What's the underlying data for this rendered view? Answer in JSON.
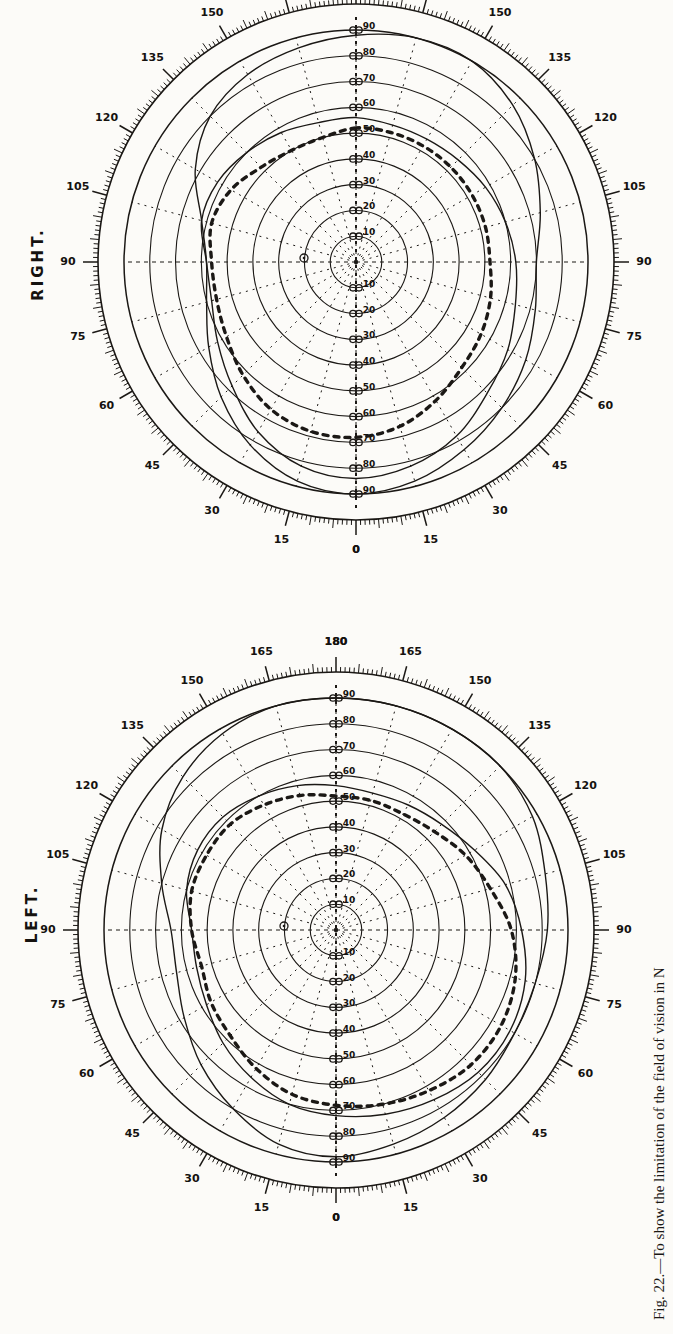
{
  "figure": {
    "caption": "Fig. 22.—To show the limitation of the field of vision in N",
    "charts": [
      {
        "id": "right",
        "title": "RIGHT.",
        "center_mark": "o"
      },
      {
        "id": "left",
        "title": "LEFT.",
        "center_mark": "o"
      }
    ]
  },
  "chart_data": [
    {
      "type": "line",
      "title": "RIGHT.",
      "subtitle": "",
      "plot_kind": "polar-perimetry-field-chart",
      "xlabel": "",
      "ylabel": "",
      "grid": true,
      "legend_position": "none",
      "angular_axis": {
        "label": "meridian degrees",
        "unit": "degrees",
        "range": [
          0,
          180
        ],
        "tick_step_minor": 1,
        "tick_step_major": 15,
        "tick_labels_upper": [
          "0",
          "15",
          "30",
          "45",
          "60",
          "75",
          "90",
          "105",
          "120",
          "135",
          "150",
          "165",
          "180"
        ],
        "tick_labels_lower": [
          "0",
          "15",
          "30",
          "45",
          "60",
          "75",
          "90",
          "105",
          "120",
          "135",
          "150",
          "165",
          "180"
        ]
      },
      "radial_axis": {
        "label": "eccentricity degrees",
        "unit": "degrees",
        "ring_values": [
          10,
          20,
          30,
          40,
          50,
          60,
          70,
          80,
          90
        ],
        "tick_labels_left": [
          "90",
          "80",
          "70",
          "60",
          "50",
          "40",
          "30",
          "20",
          "10"
        ],
        "tick_labels_right": [
          "10",
          "20",
          "30",
          "40",
          "50",
          "60",
          "70",
          "80",
          "90"
        ]
      },
      "series": [
        {
          "name": "outer field limit (solid)",
          "style": "solid",
          "points_polar_deg": [
            [
              0,
              88
            ],
            [
              15,
              86
            ],
            [
              30,
              84
            ],
            [
              45,
              80
            ],
            [
              60,
              72
            ],
            [
              75,
              62
            ],
            [
              90,
              58
            ],
            [
              105,
              60
            ],
            [
              120,
              66
            ],
            [
              135,
              74
            ],
            [
              150,
              82
            ],
            [
              165,
              88
            ],
            [
              180,
              90
            ],
            [
              195,
              88
            ],
            [
              210,
              84
            ],
            [
              225,
              80
            ],
            [
              240,
              76
            ],
            [
              255,
              72
            ],
            [
              270,
              70
            ],
            [
              285,
              74
            ],
            [
              300,
              80
            ],
            [
              315,
              86
            ],
            [
              330,
              90
            ],
            [
              345,
              90
            ]
          ]
        },
        {
          "name": "inner field limit (solid)",
          "style": "solid",
          "points_polar_deg": [
            [
              0,
              56
            ],
            [
              15,
              56
            ],
            [
              30,
              58
            ],
            [
              45,
              60
            ],
            [
              60,
              62
            ],
            [
              75,
              62
            ],
            [
              90,
              58
            ],
            [
              105,
              58
            ],
            [
              120,
              62
            ],
            [
              135,
              68
            ],
            [
              150,
              76
            ],
            [
              165,
              82
            ],
            [
              180,
              84
            ],
            [
              195,
              82
            ],
            [
              210,
              78
            ],
            [
              225,
              72
            ],
            [
              240,
              68
            ],
            [
              255,
              64
            ],
            [
              270,
              62
            ],
            [
              285,
              60
            ],
            [
              300,
              58
            ],
            [
              315,
              56
            ],
            [
              330,
              55
            ],
            [
              345,
              55
            ]
          ]
        },
        {
          "name": "colour field limit (dotted)",
          "style": "dotted-heavy",
          "points_polar_deg": [
            [
              0,
              52
            ],
            [
              15,
              50
            ],
            [
              30,
              50
            ],
            [
              45,
              52
            ],
            [
              60,
              56
            ],
            [
              75,
              58
            ],
            [
              90,
              56
            ],
            [
              105,
              56
            ],
            [
              120,
              58
            ],
            [
              135,
              62
            ],
            [
              150,
              66
            ],
            [
              165,
              68
            ],
            [
              180,
              68
            ],
            [
              195,
              66
            ],
            [
              210,
              62
            ],
            [
              225,
              58
            ],
            [
              240,
              56
            ],
            [
              255,
              54
            ],
            [
              270,
              52
            ],
            [
              285,
              52
            ],
            [
              300,
              52
            ],
            [
              315,
              52
            ],
            [
              330,
              52
            ],
            [
              345,
              52
            ]
          ]
        }
      ],
      "annotations": [
        {
          "text": "o",
          "note": "fixation / blind-spot mark near centre"
        }
      ]
    },
    {
      "type": "line",
      "title": "LEFT.",
      "subtitle": "",
      "plot_kind": "polar-perimetry-field-chart",
      "xlabel": "",
      "ylabel": "",
      "grid": true,
      "legend_position": "none",
      "angular_axis": {
        "label": "meridian degrees",
        "unit": "degrees",
        "range": [
          0,
          180
        ],
        "tick_step_minor": 1,
        "tick_step_major": 15,
        "tick_labels_upper": [
          "0",
          "15",
          "30",
          "45",
          "60",
          "75",
          "90",
          "105",
          "120",
          "135",
          "150",
          "165",
          "180"
        ],
        "tick_labels_lower": [
          "0",
          "15",
          "30",
          "45",
          "60",
          "75",
          "90",
          "105",
          "120",
          "135",
          "150",
          "165",
          "180"
        ]
      },
      "radial_axis": {
        "label": "eccentricity degrees",
        "unit": "degrees",
        "ring_values": [
          10,
          20,
          30,
          40,
          50,
          60,
          70,
          80,
          90
        ],
        "tick_labels_left": [
          "90",
          "80",
          "70",
          "60",
          "50",
          "40",
          "30",
          "20",
          "10"
        ],
        "tick_labels_right": [
          "10",
          "20",
          "30",
          "40",
          "50",
          "60",
          "70",
          "80",
          "90"
        ]
      },
      "series": [
        {
          "name": "outer field limit (solid)",
          "style": "solid",
          "points_polar_deg": [
            [
              0,
              90
            ],
            [
              15,
              90
            ],
            [
              30,
              88
            ],
            [
              45,
              84
            ],
            [
              60,
              78
            ],
            [
              75,
              70
            ],
            [
              90,
              64
            ],
            [
              105,
              64
            ],
            [
              120,
              68
            ],
            [
              135,
              74
            ],
            [
              150,
              80
            ],
            [
              165,
              86
            ],
            [
              180,
              88
            ],
            [
              195,
              86
            ],
            [
              210,
              84
            ],
            [
              225,
              82
            ],
            [
              240,
              80
            ],
            [
              255,
              80
            ],
            [
              270,
              82
            ],
            [
              285,
              84
            ],
            [
              300,
              88
            ],
            [
              315,
              90
            ],
            [
              330,
              90
            ],
            [
              345,
              90
            ]
          ]
        },
        {
          "name": "inner field limit (solid)",
          "style": "solid",
          "points_polar_deg": [
            [
              0,
              56
            ],
            [
              15,
              58
            ],
            [
              30,
              60
            ],
            [
              45,
              62
            ],
            [
              60,
              62
            ],
            [
              75,
              60
            ],
            [
              90,
              56
            ],
            [
              105,
              56
            ],
            [
              120,
              58
            ],
            [
              135,
              62
            ],
            [
              150,
              66
            ],
            [
              165,
              70
            ],
            [
              180,
              72
            ],
            [
              195,
              74
            ],
            [
              210,
              76
            ],
            [
              225,
              78
            ],
            [
              240,
              78
            ],
            [
              255,
              76
            ],
            [
              270,
              72
            ],
            [
              285,
              68
            ],
            [
              300,
              62
            ],
            [
              315,
              58
            ],
            [
              330,
              56
            ],
            [
              345,
              55
            ]
          ]
        },
        {
          "name": "colour field limit (dotted)",
          "style": "dotted-heavy",
          "points_polar_deg": [
            [
              0,
              52
            ],
            [
              15,
              54
            ],
            [
              30,
              56
            ],
            [
              45,
              58
            ],
            [
              60,
              58
            ],
            [
              75,
              58
            ],
            [
              90,
              56
            ],
            [
              105,
              54
            ],
            [
              120,
              56
            ],
            [
              135,
              58
            ],
            [
              150,
              62
            ],
            [
              165,
              66
            ],
            [
              180,
              68
            ],
            [
              195,
              70
            ],
            [
              210,
              72
            ],
            [
              225,
              74
            ],
            [
              240,
              74
            ],
            [
              255,
              72
            ],
            [
              270,
              68
            ],
            [
              285,
              62
            ],
            [
              300,
              58
            ],
            [
              315,
              54
            ],
            [
              330,
              52
            ],
            [
              345,
              52
            ]
          ]
        }
      ],
      "annotations": [
        {
          "text": "o",
          "note": "fixation / blind-spot mark near centre"
        }
      ]
    }
  ],
  "colors": {
    "ink": "#1b1815",
    "paper": "#fcfbf8"
  }
}
